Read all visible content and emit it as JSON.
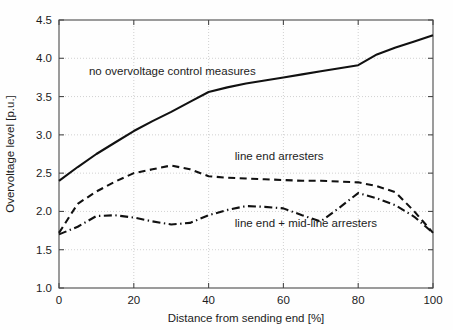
{
  "chart_data": {
    "type": "line",
    "title": "",
    "xlabel": "Distance from sending end [%]",
    "ylabel": "Overvoltage level [p.u.]",
    "xlim": [
      0,
      100
    ],
    "ylim": [
      1.0,
      4.5
    ],
    "xticks": [
      0,
      20,
      40,
      60,
      80,
      100
    ],
    "xtick_labels": [
      "0",
      "20",
      "40",
      "60",
      "80",
      "100"
    ],
    "yticks": [
      1.0,
      1.5,
      2.0,
      2.5,
      3.0,
      3.5,
      4.0,
      4.5
    ],
    "ytick_labels": [
      "1.0",
      "1.5",
      "2.0",
      "2.5",
      "3.0",
      "3.5",
      "4.0",
      "4.5"
    ],
    "grid": true,
    "legend_position": "inline-annotations",
    "series": [
      {
        "name": "no overvoltage control measures",
        "style": "solid",
        "x": [
          0,
          5,
          10,
          15,
          20,
          25,
          30,
          35,
          40,
          45,
          50,
          55,
          60,
          65,
          70,
          75,
          80,
          85,
          90,
          95,
          100
        ],
        "values": [
          2.4,
          2.58,
          2.75,
          2.9,
          3.05,
          3.18,
          3.3,
          3.43,
          3.56,
          3.62,
          3.67,
          3.71,
          3.75,
          3.79,
          3.83,
          3.87,
          3.91,
          4.05,
          4.14,
          4.22,
          4.3
        ]
      },
      {
        "name": "line end arresters",
        "style": "dashed",
        "x": [
          0,
          5,
          10,
          15,
          20,
          25,
          30,
          35,
          40,
          45,
          50,
          55,
          60,
          65,
          70,
          75,
          80,
          85,
          90,
          95,
          100
        ],
        "values": [
          1.72,
          2.1,
          2.26,
          2.39,
          2.5,
          2.55,
          2.6,
          2.55,
          2.46,
          2.44,
          2.43,
          2.42,
          2.41,
          2.4,
          2.4,
          2.39,
          2.38,
          2.33,
          2.25,
          2.0,
          1.72
        ]
      },
      {
        "name": "line end + mid-line arresters",
        "style": "dash-dot",
        "x": [
          0,
          5,
          10,
          15,
          20,
          25,
          30,
          35,
          40,
          45,
          50,
          55,
          60,
          65,
          70,
          75,
          80,
          85,
          90,
          95,
          100
        ],
        "values": [
          1.7,
          1.8,
          1.94,
          1.95,
          1.92,
          1.87,
          1.83,
          1.85,
          1.95,
          2.02,
          2.07,
          2.06,
          2.04,
          1.95,
          1.87,
          2.05,
          2.24,
          2.17,
          2.08,
          1.93,
          1.72
        ]
      }
    ],
    "annotations": [
      {
        "text": "no overvoltage control measures",
        "x": 8,
        "y": 3.78
      },
      {
        "text": "line end arresters",
        "x": 47,
        "y": 2.67
      },
      {
        "text": "line end + mid-line arresters",
        "x": 47,
        "y": 1.8
      }
    ]
  },
  "axes": {
    "x_title": "Distance from sending end [%]",
    "y_title": "Overvoltage level [p.u.]"
  },
  "colors": {
    "curve": "#111111",
    "grid": "#bdbdbd",
    "frame": "#4a4a4a",
    "background": "#fefefe"
  }
}
